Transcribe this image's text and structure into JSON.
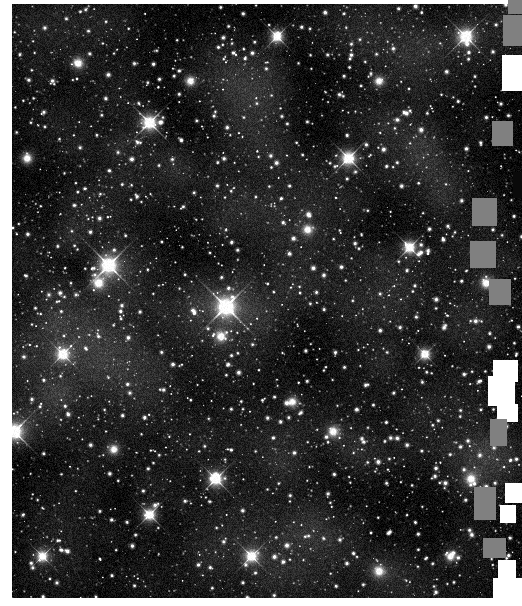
{
  "image": {
    "title": "Dense Galactic Star Field",
    "kind": "astronomical-image",
    "colormap": "grayscale",
    "alt_text": "Dense field of thousands of white stars on a black sky background",
    "frame": {
      "x": 12,
      "y": 4,
      "width": 510,
      "height": 594
    },
    "canvas": {
      "width": 522,
      "height": 606
    },
    "background_color": "#ffffff",
    "sky_color": "#050505",
    "star_color": "#ffffff",
    "artifact_gray": "#808080",
    "artifact_white": "#ffffff"
  },
  "sky_data": {
    "type": "scatter",
    "description": "Dense stellar field rendered as point sources with gaussian PSF profiles",
    "seed": 20240517,
    "faint_star_count": 5200,
    "mid_star_count": 900,
    "noise_level": 0.16,
    "background_glow": 0.08,
    "bright_stars": [
      {
        "x": 0.19,
        "y": 0.44,
        "r": 9.5,
        "spikes": true,
        "intensity": 1.0
      },
      {
        "x": 0.17,
        "y": 0.47,
        "r": 6.0,
        "spikes": false,
        "intensity": 0.85
      },
      {
        "x": 0.42,
        "y": 0.51,
        "r": 10.5,
        "spikes": true,
        "intensity": 1.0
      },
      {
        "x": 0.27,
        "y": 0.2,
        "r": 8.0,
        "spikes": true,
        "intensity": 0.95
      },
      {
        "x": 0.66,
        "y": 0.26,
        "r": 7.5,
        "spikes": true,
        "intensity": 0.92
      },
      {
        "x": 0.89,
        "y": 0.055,
        "r": 8.0,
        "spikes": true,
        "intensity": 0.95
      },
      {
        "x": 0.52,
        "y": 0.055,
        "r": 6.5,
        "spikes": true,
        "intensity": 0.88
      },
      {
        "x": 0.005,
        "y": 0.72,
        "r": 9.0,
        "spikes": true,
        "intensity": 1.0
      },
      {
        "x": 0.1,
        "y": 0.59,
        "r": 6.5,
        "spikes": true,
        "intensity": 0.86
      },
      {
        "x": 0.4,
        "y": 0.8,
        "r": 7.5,
        "spikes": true,
        "intensity": 0.92
      },
      {
        "x": 0.41,
        "y": 0.56,
        "r": 5.5,
        "spikes": false,
        "intensity": 0.8
      },
      {
        "x": 0.78,
        "y": 0.41,
        "r": 6.5,
        "spikes": true,
        "intensity": 0.88
      },
      {
        "x": 0.81,
        "y": 0.59,
        "r": 6.0,
        "spikes": true,
        "intensity": 0.85
      },
      {
        "x": 0.27,
        "y": 0.86,
        "r": 6.5,
        "spikes": true,
        "intensity": 0.88
      },
      {
        "x": 0.63,
        "y": 0.72,
        "r": 5.5,
        "spikes": false,
        "intensity": 0.82
      },
      {
        "x": 0.06,
        "y": 0.93,
        "r": 6.0,
        "spikes": true,
        "intensity": 0.85
      },
      {
        "x": 0.47,
        "y": 0.93,
        "r": 6.5,
        "spikes": true,
        "intensity": 0.9
      },
      {
        "x": 0.93,
        "y": 0.47,
        "r": 5.5,
        "spikes": false,
        "intensity": 0.82
      },
      {
        "x": 0.35,
        "y": 0.13,
        "r": 5.0,
        "spikes": false,
        "intensity": 0.8
      },
      {
        "x": 0.72,
        "y": 0.13,
        "r": 5.0,
        "spikes": false,
        "intensity": 0.78
      },
      {
        "x": 0.13,
        "y": 0.1,
        "r": 5.5,
        "spikes": false,
        "intensity": 0.8
      },
      {
        "x": 0.58,
        "y": 0.38,
        "r": 5.0,
        "spikes": false,
        "intensity": 0.78
      },
      {
        "x": 0.9,
        "y": 0.8,
        "r": 5.5,
        "spikes": false,
        "intensity": 0.8
      },
      {
        "x": 0.2,
        "y": 0.75,
        "r": 5.0,
        "spikes": false,
        "intensity": 0.78
      },
      {
        "x": 0.55,
        "y": 0.67,
        "r": 5.0,
        "spikes": false,
        "intensity": 0.78
      },
      {
        "x": 0.03,
        "y": 0.26,
        "r": 5.5,
        "spikes": false,
        "intensity": 0.8
      },
      {
        "x": 0.86,
        "y": 0.93,
        "r": 5.0,
        "spikes": false,
        "intensity": 0.78
      },
      {
        "x": 0.72,
        "y": 0.955,
        "r": 5.5,
        "spikes": false,
        "intensity": 0.8
      }
    ]
  },
  "edge_artifacts": [
    {
      "id": "block-1",
      "tone": "gray",
      "x": 503,
      "y": 15,
      "w": 19,
      "h": 31
    },
    {
      "id": "block-2",
      "tone": "white",
      "x": 502,
      "y": 55,
      "w": 20,
      "h": 36
    },
    {
      "id": "block-3",
      "tone": "gray",
      "x": 492,
      "y": 121,
      "w": 21,
      "h": 25
    },
    {
      "id": "block-4",
      "tone": "gray",
      "x": 472,
      "y": 198,
      "w": 25,
      "h": 28
    },
    {
      "id": "block-5",
      "tone": "gray",
      "x": 470,
      "y": 241,
      "w": 26,
      "h": 27
    },
    {
      "id": "block-6",
      "tone": "gray",
      "x": 489,
      "y": 279,
      "w": 22,
      "h": 26
    },
    {
      "id": "block-7",
      "tone": "white",
      "x": 493,
      "y": 360,
      "w": 25,
      "h": 22
    },
    {
      "id": "block-8",
      "tone": "white",
      "x": 488,
      "y": 376,
      "w": 27,
      "h": 30
    },
    {
      "id": "block-9",
      "tone": "white",
      "x": 497,
      "y": 404,
      "w": 21,
      "h": 18
    },
    {
      "id": "block-10",
      "tone": "gray",
      "x": 490,
      "y": 419,
      "w": 17,
      "h": 27
    },
    {
      "id": "block-11",
      "tone": "gray",
      "x": 474,
      "y": 487,
      "w": 22,
      "h": 33
    },
    {
      "id": "block-12",
      "tone": "white",
      "x": 505,
      "y": 483,
      "w": 17,
      "h": 20
    },
    {
      "id": "block-13",
      "tone": "white",
      "x": 500,
      "y": 505,
      "w": 16,
      "h": 18
    },
    {
      "id": "block-14",
      "tone": "gray",
      "x": 483,
      "y": 538,
      "w": 23,
      "h": 20
    },
    {
      "id": "block-15",
      "tone": "white",
      "x": 498,
      "y": 560,
      "w": 18,
      "h": 20
    },
    {
      "id": "block-16",
      "tone": "white",
      "x": 493,
      "y": 578,
      "w": 29,
      "h": 28
    },
    {
      "id": "block-17",
      "tone": "gray",
      "x": 508,
      "y": 0,
      "w": 14,
      "h": 14
    },
    {
      "id": "block-18",
      "tone": "dark",
      "x": 513,
      "y": 172,
      "w": 9,
      "h": 26
    }
  ]
}
